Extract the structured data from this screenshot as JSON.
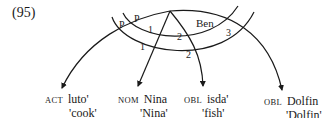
{
  "example_number": "(95)",
  "relation_labels": {
    "p_outer": "P",
    "p_inner": "P",
    "arc1_upper": "1",
    "arc1_lower": "1",
    "arc2_upper": "2",
    "arc2_lower": "2",
    "ben": "Ben",
    "arc3": "3"
  },
  "dependents": [
    {
      "case": "ACT",
      "form": "luto'",
      "gloss": "'cook'"
    },
    {
      "case": "NOM",
      "form": "Nina",
      "gloss": "'Nina'"
    },
    {
      "case": "OBL",
      "form": "isda'",
      "gloss": "'fish'"
    },
    {
      "case": "OBL",
      "form": "Dolfin",
      "gloss": "'Dolfin'"
    }
  ]
}
